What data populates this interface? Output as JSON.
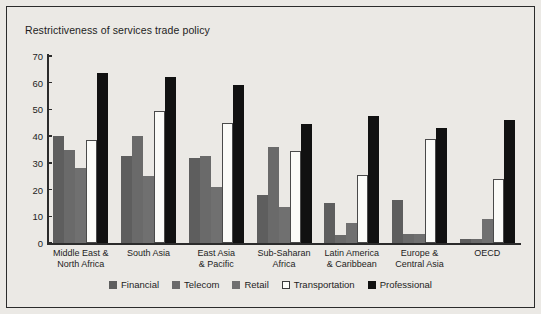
{
  "figure": {
    "title": "Restrictiveness of services trade policy",
    "background_color": "#ebe9e5",
    "border_color": "#2b2b2b"
  },
  "axis": {
    "y_ticks": [
      "0",
      "10",
      "20",
      "30",
      "40",
      "50",
      "60",
      "70"
    ],
    "y_min": 0,
    "y_max": 70
  },
  "legend": {
    "items": [
      {
        "label": "Financial",
        "color": "#5e5e5e",
        "swatch": "filled-square-dark-gray"
      },
      {
        "label": "Telecom",
        "color": "#6a6a6a",
        "swatch": "filled-square-gray"
      },
      {
        "label": "Retail",
        "color": "#707070",
        "swatch": "filled-square-light-gray"
      },
      {
        "label": "Transportation",
        "color": "#fbfbf8",
        "swatch": "open-square-white"
      },
      {
        "label": "Professional",
        "color": "#111111",
        "swatch": "filled-square-black"
      }
    ]
  },
  "chart_data": {
    "type": "bar",
    "title": "Restrictiveness of services trade policy",
    "xlabel": "",
    "ylabel": "",
    "ylim": [
      0,
      70
    ],
    "ytick_step": 10,
    "grid": false,
    "legend_position": "bottom",
    "categories": [
      "Middle East &\nNorth Africa",
      "South Asia",
      "East Asia\n& Pacific",
      "Sub-Saharan\nAfrica",
      "Latin America\n& Caribbean",
      "Europe &\nCentral Asia",
      "OECD"
    ],
    "series": [
      {
        "name": "Financial",
        "color": "#5e5e5e",
        "values": [
          40,
          32.5,
          32,
          18,
          15,
          16,
          1.5
        ]
      },
      {
        "name": "Telecom",
        "color": "#6a6a6a",
        "values": [
          35,
          40,
          32.5,
          36,
          3,
          3.5,
          1.5
        ]
      },
      {
        "name": "Retail",
        "color": "#707070",
        "values": [
          28,
          25,
          21,
          13.5,
          7.5,
          3.5,
          9
        ]
      },
      {
        "name": "Transportation",
        "color": "#fbfbf8",
        "values": [
          38.5,
          49.5,
          45,
          34.5,
          25.5,
          39,
          24
        ]
      },
      {
        "name": "Professional",
        "color": "#111111",
        "values": [
          63.5,
          62,
          59,
          44.5,
          47.5,
          43,
          46
        ]
      }
    ]
  }
}
